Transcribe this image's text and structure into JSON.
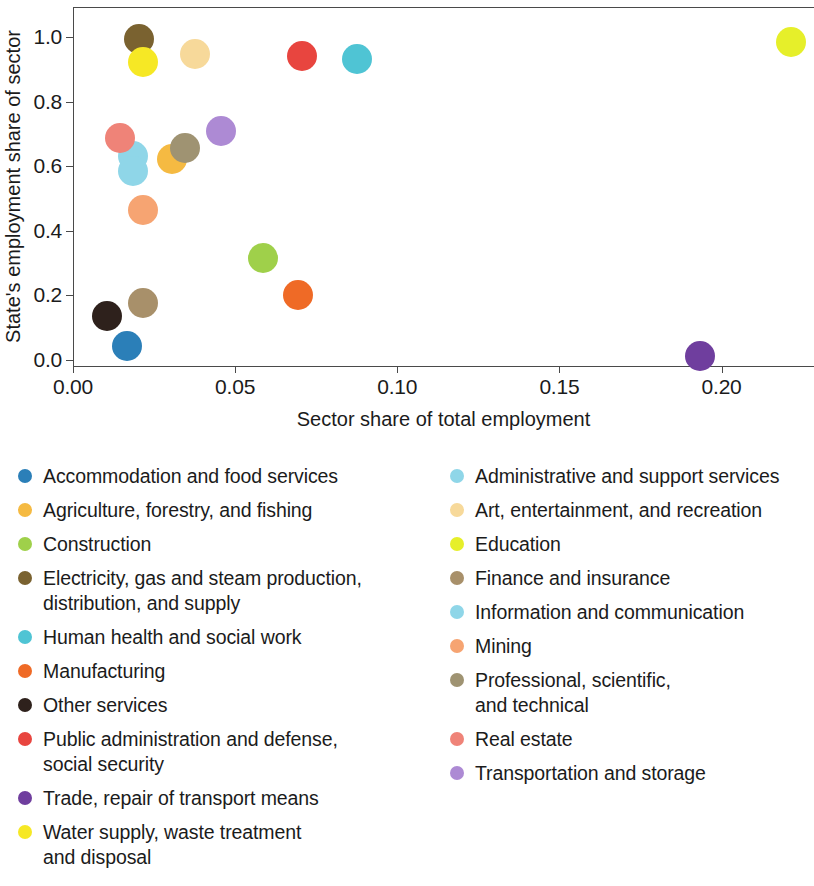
{
  "chart_data": {
    "type": "scatter",
    "title": "",
    "xlabel": "Sector share of total employment",
    "ylabel": "State's employment share of sector",
    "xlim": [
      0.0,
      0.2285
    ],
    "ylim": [
      -0.019,
      1.093
    ],
    "xticks": [
      "0.00",
      "0.05",
      "0.10",
      "0.15",
      "0.20"
    ],
    "xtick_values": [
      0.0,
      0.05,
      0.1,
      0.15,
      0.2
    ],
    "yticks": [
      "0.0",
      "0.2",
      "0.4",
      "0.6",
      "0.8",
      "1.0"
    ],
    "ytick_values": [
      0.0,
      0.2,
      0.4,
      0.6,
      0.8,
      1.0
    ],
    "grid": false,
    "legend_position": "below",
    "legend_columns": 2,
    "marker_size_px": 30,
    "points": [
      {
        "name": "Accommodation and food services",
        "x": 0.0165,
        "y": 0.042,
        "color": "#2b7fb8"
      },
      {
        "name": "Administrative and support services",
        "x": 0.0185,
        "y": 0.633,
        "color": "#8fd6e8"
      },
      {
        "name": "Agriculture, forestry, and fishing",
        "x": 0.0305,
        "y": 0.622,
        "color": "#f5ba42"
      },
      {
        "name": "Art, entertainment, and recreation",
        "x": 0.0375,
        "y": 0.948,
        "color": "#f7d99a"
      },
      {
        "name": "Construction",
        "x": 0.0585,
        "y": 0.317,
        "color": "#9fd04a"
      },
      {
        "name": "Education",
        "x": 0.2215,
        "y": 0.985,
        "color": "#e6ef2a"
      },
      {
        "name": "Electricity, gas and steam production, distribution, and supply",
        "x": 0.0205,
        "y": 0.993,
        "color": "#7a6230"
      },
      {
        "name": "Finance and insurance",
        "x": 0.0215,
        "y": 0.175,
        "color": "#a8906a"
      },
      {
        "name": "Human health and social work",
        "x": 0.0875,
        "y": 0.933,
        "color": "#4fc4d4"
      },
      {
        "name": "Information and communication",
        "x": 0.0185,
        "y": 0.585,
        "color": "#8fd6e8"
      },
      {
        "name": "Manufacturing",
        "x": 0.0695,
        "y": 0.2,
        "color": "#ef6a26"
      },
      {
        "name": "Mining",
        "x": 0.0215,
        "y": 0.465,
        "color": "#f6a472"
      },
      {
        "name": "Other services",
        "x": 0.0105,
        "y": 0.135,
        "color": "#2e211c"
      },
      {
        "name": "Professional, scientific, and technical",
        "x": 0.0345,
        "y": 0.655,
        "color": "#9f9372"
      },
      {
        "name": "Public administration and defense, social security",
        "x": 0.0705,
        "y": 0.94,
        "color": "#e8453f"
      },
      {
        "name": "Real estate",
        "x": 0.0145,
        "y": 0.688,
        "color": "#ef8378"
      },
      {
        "name": "Trade, repair of transport means",
        "x": 0.1935,
        "y": 0.012,
        "color": "#6f3e9e"
      },
      {
        "name": "Transportation and storage",
        "x": 0.0455,
        "y": 0.71,
        "color": "#ad8ad4"
      },
      {
        "name": "Water supply, waste treatment and disposal",
        "x": 0.0215,
        "y": 0.923,
        "color": "#f6e825"
      }
    ]
  },
  "legend": {
    "left_column": [
      {
        "label": "Accommodation and food services",
        "color": "#2b7fb8"
      },
      {
        "label": "Agriculture, forestry, and fishing",
        "color": "#f5ba42"
      },
      {
        "label": "Construction",
        "color": "#9fd04a"
      },
      {
        "label": "Electricity, gas and steam production,\ndistribution, and supply",
        "color": "#7a6230"
      },
      {
        "label": "Human health and social work",
        "color": "#4fc4d4"
      },
      {
        "label": "Manufacturing",
        "color": "#ef6a26"
      },
      {
        "label": "Other services",
        "color": "#2e211c"
      },
      {
        "label": "Public administration and defense,\nsocial security",
        "color": "#e8453f"
      },
      {
        "label": "Trade, repair of transport means",
        "color": "#6f3e9e"
      },
      {
        "label": "Water supply, waste treatment\nand disposal",
        "color": "#f6e825"
      }
    ],
    "right_column": [
      {
        "label": "Administrative and support services",
        "color": "#8fd6e8"
      },
      {
        "label": "Art, entertainment, and recreation",
        "color": "#f7d99a"
      },
      {
        "label": "Education",
        "color": "#e6ef2a"
      },
      {
        "label": "Finance and insurance",
        "color": "#a8906a"
      },
      {
        "label": "Information and communication",
        "color": "#8fd6e8"
      },
      {
        "label": "Mining",
        "color": "#f6a472"
      },
      {
        "label": "Professional, scientific,\nand technical",
        "color": "#9f9372"
      },
      {
        "label": "Real estate",
        "color": "#ef8378"
      },
      {
        "label": "Transportation and storage",
        "color": "#ad8ad4"
      }
    ]
  }
}
